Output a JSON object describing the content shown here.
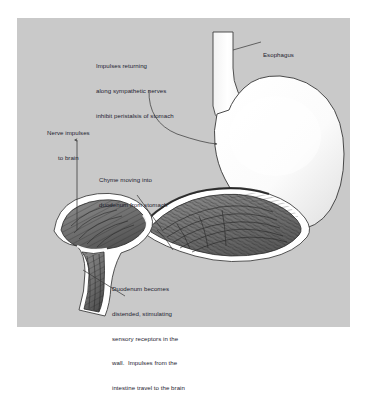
{
  "figure": {
    "panel_background": "#c9c9c9",
    "page_background": "#ffffff",
    "text_color": "#1d2230",
    "outline_color": "#3a3a3a",
    "organ_fill": "#fdfdfd",
    "mucosa_fill": "#6e6e6e"
  },
  "annotations": {
    "sympathetic": {
      "line1": "Impulses returning",
      "line2": "along sympathetic nerves",
      "line3": "inhibit peristalsis of stomach"
    },
    "esophagus": {
      "label": "Esophagus"
    },
    "nerve_impulses": {
      "line1": "Nerve impulses",
      "line2": "to brain"
    },
    "chyme": {
      "line1": "Chyme moving into",
      "line2": "duodenum from stomach"
    },
    "duodenum": {
      "line1": "Duodenum becomes",
      "line2": "distended, stimulating",
      "line3": "sensory receptors in the",
      "line4": "wall.  Impulses from the",
      "line5": "intestine travel to the brain"
    }
  }
}
